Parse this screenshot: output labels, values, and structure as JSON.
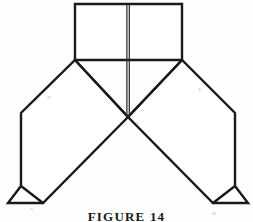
{
  "page": {
    "caption": "FIGURE 14",
    "background_color": "#fdfdfd",
    "ink_color": "#1a1a1a",
    "width": 253,
    "height": 222
  },
  "figure": {
    "title": "FIGURE 14",
    "kind": "line-drawing",
    "stroke_color": "#1a1a1a",
    "fill_color": "#ffffff",
    "stroke_width": 2.4,
    "center_crease_color": "#2a2a2a",
    "shapes": {
      "top_panel": {
        "name": "top-rectangle-panel",
        "points": "75,4 182,4 182,60 75,60"
      },
      "center_crease": {
        "name": "center-double-crease",
        "x": 128,
        "y_top": 4,
        "y_bottom": 117,
        "gap": 2.2
      },
      "left_wing": {
        "name": "left-wing-panel",
        "points": "75,60 128,117 43,203 8,203 21,186 21,113"
      },
      "right_wing": {
        "name": "right-wing-panel",
        "points": "182,60 128,117 213,203 248,203 235,186 235,113"
      },
      "left_foot_flap": {
        "name": "left-foot-flap",
        "points": "21,186 43,203 8,203"
      },
      "right_foot_flap": {
        "name": "right-foot-flap",
        "points": "235,186 213,203 248,203"
      },
      "left_diagonal": {
        "name": "left-diagonal-fold",
        "from": "75,60",
        "to": "128,117"
      },
      "right_diagonal": {
        "name": "right-diagonal-fold",
        "from": "182,60",
        "to": "128,117"
      },
      "center_to_left_foot": {
        "name": "center-to-left-foot-edge",
        "from": "128,117",
        "to": "43,203"
      },
      "center_to_right_foot": {
        "name": "center-to-right-foot-edge",
        "from": "128,117",
        "to": "213,203"
      }
    }
  }
}
